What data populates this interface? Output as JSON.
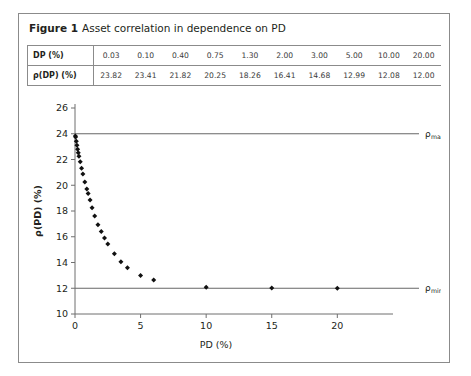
{
  "figure": {
    "label": "Figure 1",
    "title": "Asset correlation in dependence on PD"
  },
  "table": {
    "row_headers": [
      "DP (%)",
      "ρ(DP) (%)"
    ],
    "pd_values": [
      "0.03",
      "0.10",
      "0.40",
      "0.75",
      "1.30",
      "2.00",
      "3.00",
      "5.00",
      "10.00",
      "20.00"
    ],
    "rho_values": [
      "23.82",
      "23.41",
      "21.82",
      "20.25",
      "18.26",
      "16.41",
      "14.68",
      "12.99",
      "12.08",
      "12.00"
    ]
  },
  "annotations": {
    "rho_max": "ρmax = 24%",
    "rho_max_sub": "max",
    "rho_max_value": "= 24%",
    "rho_min": "ρmin = 12%",
    "rho_min_sub": "min",
    "rho_min_value": "= 12%",
    "rho_symbol": "ρ"
  },
  "axis": {
    "xlabel": "PD (%)",
    "ylabel": "ρ(PD) (%)",
    "xticks": [
      "0",
      "5",
      "10",
      "15",
      "20"
    ],
    "yticks": [
      "10",
      "12",
      "14",
      "16",
      "18",
      "20",
      "22",
      "24",
      "26"
    ]
  },
  "colors": {
    "border": "#8b8b8b",
    "text": "#231f20",
    "marker": "#111111",
    "axis": "#6f6f6f",
    "refline": "#555555"
  },
  "chart_data": {
    "type": "scatter",
    "title": "Asset correlation in dependence on PD",
    "xlabel": "PD (%)",
    "ylabel": "ρ(PD) (%)",
    "xlim": [
      0,
      21.5
    ],
    "ylim": [
      10,
      26
    ],
    "xticks": [
      0,
      5,
      10,
      15,
      20
    ],
    "yticks": [
      10,
      12,
      14,
      16,
      18,
      20,
      22,
      24,
      26
    ],
    "grid": false,
    "legend": null,
    "reference_lines": [
      {
        "name": "rho_max",
        "y": 24,
        "label": "ρmax = 24%"
      },
      {
        "name": "rho_min",
        "y": 12,
        "label": "ρmin = 12%"
      }
    ],
    "series": [
      {
        "name": "ρ(PD)",
        "marker": "diamond",
        "x": [
          0.03,
          0.05,
          0.1,
          0.15,
          0.2,
          0.25,
          0.3,
          0.4,
          0.5,
          0.6,
          0.75,
          0.9,
          1.0,
          1.15,
          1.3,
          1.5,
          1.75,
          2.0,
          2.25,
          2.5,
          3.0,
          3.5,
          4.0,
          5.0,
          6.0,
          10.0,
          15.0,
          20.0
        ],
        "y": [
          23.82,
          23.74,
          23.41,
          23.1,
          22.8,
          22.52,
          22.25,
          21.82,
          21.33,
          20.88,
          20.25,
          19.7,
          19.35,
          18.86,
          18.26,
          17.62,
          16.94,
          16.41,
          15.9,
          15.43,
          14.68,
          14.05,
          13.6,
          12.99,
          12.65,
          12.08,
          12.02,
          12.0
        ]
      }
    ]
  }
}
